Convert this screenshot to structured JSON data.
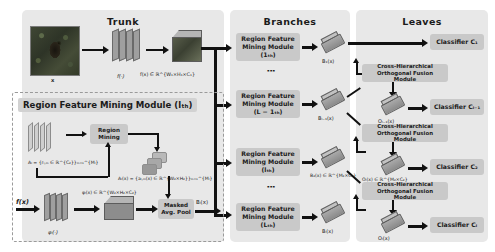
{
  "figure": {
    "type": "architecture-diagram",
    "columns": [
      {
        "id": "trunk",
        "title": "Trunk"
      },
      {
        "id": "branches",
        "title": "Branches"
      },
      {
        "id": "leaves",
        "title": "Leaves"
      }
    ]
  },
  "trunk": {
    "input_label": "x",
    "backbone_label": "f(·)",
    "feature_label": "f(x) ∈ ℝ^{W₁×H₁×C₁}",
    "rfm_panel_title": "Region Feature Mining Module (lₜₕ)",
    "region_mining_box": "Region\nMining",
    "region_mining_line1": "Region",
    "region_mining_line2": "Mining",
    "masked_pool_line1": "Masked",
    "masked_pool_line2": "Avg. Pool",
    "input_feature_label": "f(x)",
    "phi_label": "φₗ(·)",
    "phi_out_label": "φₗ(x) ∈ ℝ^{W₂×H₂×C₂}",
    "anchor_label": "Aₗ = {rₗ,ₘ ∈ ℝ^{C₂}}ₘ₌₁^{Mₗ}",
    "attention_label": "Aₗ(x) = {aₗ,ₘ(x) ∈ ℝ^{W₂×H₂}}ₘ₌₁^{Mₗ}",
    "branch_out_label": "Bₗ(x)"
  },
  "branches": {
    "modules": [
      {
        "label_line1": "Region Feature",
        "label_line2": "Mining Module",
        "label_line3": "(1ₜₕ)",
        "out": "B₁(x)",
        "out_dim": ""
      },
      {
        "label_line1": "Region Feature",
        "label_line2": "Mining Module",
        "label_line3": "(L − 1ₜₕ)",
        "out": "Bₗ₋₁(x)",
        "out_dim": ""
      },
      {
        "label_line1": "Region Feature",
        "label_line2": "Mining Module",
        "label_line3": "(lₜₕ)",
        "out": "B₂(x) ∈ ℝ^{M₂×C₂}",
        "out_dim": ""
      },
      {
        "label_line1": "Region Feature",
        "label_line2": "Mining Module",
        "label_line3": "(Lₜₕ)",
        "out": "Bₗ(x)",
        "out_dim": ""
      }
    ],
    "ellipsis": "⋮"
  },
  "leaves": {
    "fusion_label_line1": "Cross-Hierarchical",
    "fusion_label_line2": "Orthogonal Fusion Module",
    "fusion_modules": [
      {
        "out": "Oₗ₋₁(x)"
      },
      {
        "out": "Oₗ(x) ∈ ℝ^{M₂×C₂}"
      },
      {
        "out": "Oₗ(x)"
      }
    ],
    "classifiers": [
      {
        "label": "Classifier C₁"
      },
      {
        "label": "Classifier Cₗ₋₁"
      },
      {
        "label": "Classifier C₂"
      },
      {
        "label": "Classifier Cₗ"
      }
    ]
  },
  "colors": {
    "panel_bg": "#e8e8e8",
    "box_bg": "#c9c9c9",
    "arrow": "#111111",
    "text": "#1b1b1b"
  }
}
